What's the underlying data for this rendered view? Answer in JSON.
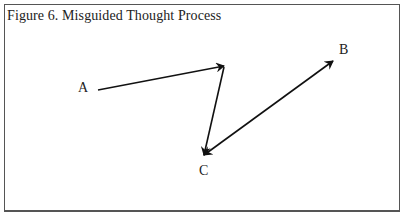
{
  "figure": {
    "caption": "Figure 6. Misguided Thought Process"
  },
  "nodes": [
    {
      "id": "A",
      "label": "A"
    },
    {
      "id": "B",
      "label": "B"
    },
    {
      "id": "C",
      "label": "C"
    }
  ],
  "edges": [
    {
      "from": "A",
      "to": "turn",
      "head": "end"
    },
    {
      "from": "turn",
      "to": "C",
      "head": "end"
    },
    {
      "from": "C",
      "to": "B",
      "head": "both"
    }
  ],
  "colors": {
    "stroke": "#111111",
    "border": "#555555",
    "text": "#222222"
  }
}
